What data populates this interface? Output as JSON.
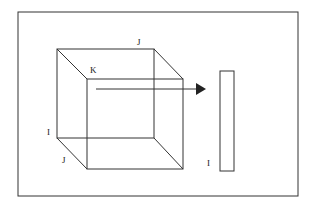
{
  "diagram": {
    "labels": {
      "top_edge": "J",
      "depth_edge": "K",
      "left_edge": "I",
      "bottom_depth_edge": "J",
      "slice_label": "I"
    },
    "colors": {
      "stroke": "#333333",
      "background": "#ffffff"
    }
  }
}
